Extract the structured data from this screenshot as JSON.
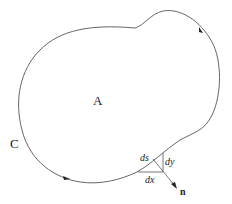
{
  "diagram": {
    "type": "closed-curve region with boundary element",
    "region_label": "A",
    "curve_label": "C",
    "element_labels": {
      "arc": "ds",
      "vertical": "dy",
      "horizontal": "dx"
    },
    "normal_label": "n",
    "colors": {
      "stroke": "#555555",
      "text": "#222222",
      "background": "#ffffff"
    },
    "orientation": "counterclockwise arrows on curve"
  }
}
